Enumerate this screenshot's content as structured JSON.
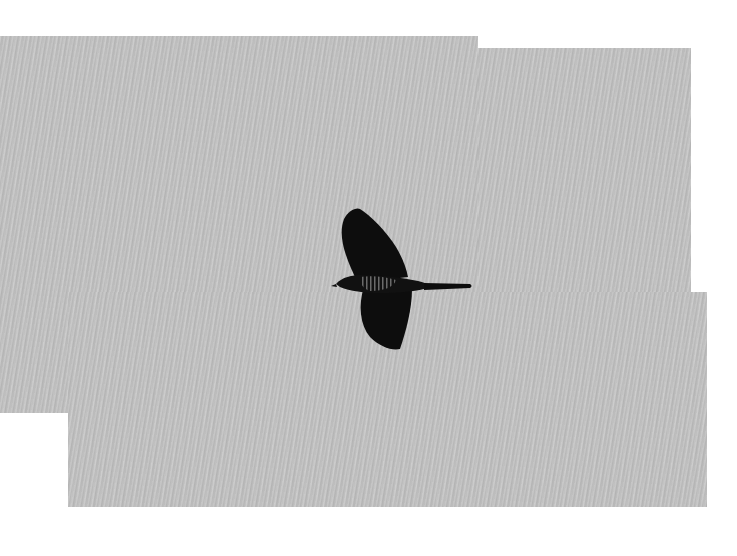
{
  "image": {
    "subject": "bird in flight",
    "description": "Dark silhouette of a cuckoo-like bird with barred underside, wings spread, flying left against an overcast gray sky; composite photo with stepped white margins",
    "colors": {
      "sky": "#c4c4c4",
      "bird": "#0d0d0d",
      "background": "#ffffff"
    }
  }
}
